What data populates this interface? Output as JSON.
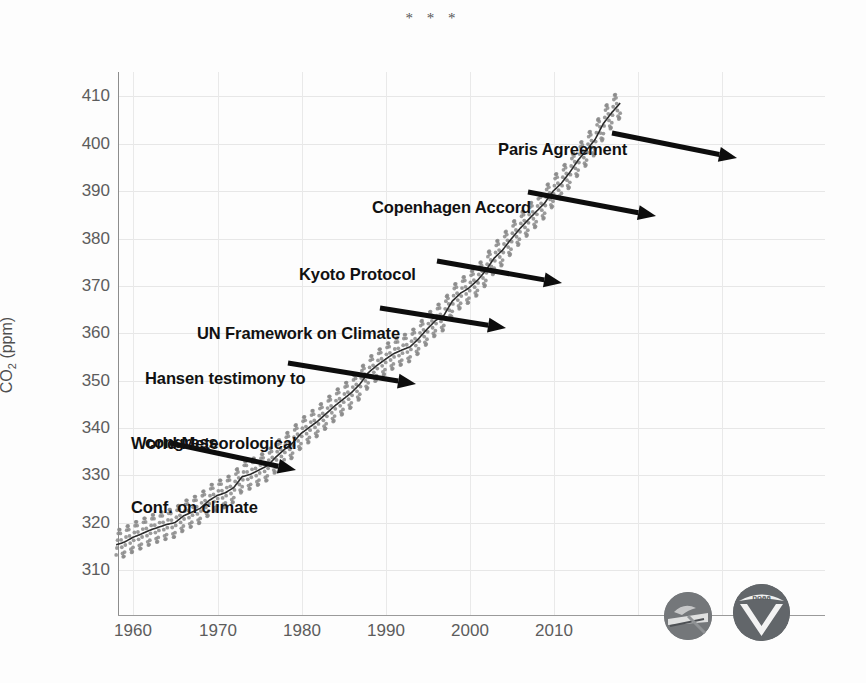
{
  "document": {
    "separator": "* * *"
  },
  "chart_data": {
    "type": "line",
    "title": "",
    "subtitle": "",
    "xlabel": "",
    "ylabel": "CO2 (ppm)",
    "ylabel_parts": {
      "prefix": "CO",
      "sub": "2",
      "suffix": " (ppm)"
    },
    "xlim": [
      1958,
      2018
    ],
    "ylim": [
      305,
      414
    ],
    "grid": true,
    "legend": null,
    "y_ticks": [
      410,
      400,
      390,
      380,
      370,
      360,
      350,
      340,
      330,
      320,
      310
    ],
    "x_ticks": [
      1960,
      1970,
      1980,
      1990,
      2000,
      2010
    ],
    "series": [
      {
        "name": "Monthly mean CO2 (seasonal cycle)",
        "style": "gray-dots",
        "color": "#8a8a8a",
        "note": "monthly values oscillate about the trend by roughly +/-3 ppm"
      },
      {
        "name": "Seasonally corrected trend",
        "style": "dark-line",
        "color": "#2a2a2a"
      }
    ],
    "x": [
      1958,
      1959,
      1960,
      1961,
      1962,
      1963,
      1964,
      1965,
      1966,
      1967,
      1968,
      1969,
      1970,
      1971,
      1972,
      1973,
      1974,
      1975,
      1976,
      1977,
      1978,
      1979,
      1980,
      1981,
      1982,
      1983,
      1984,
      1985,
      1986,
      1987,
      1988,
      1989,
      1990,
      1991,
      1992,
      1993,
      1994,
      1995,
      1996,
      1997,
      1998,
      1999,
      2000,
      2001,
      2002,
      2003,
      2004,
      2005,
      2006,
      2007,
      2008,
      2009,
      2010,
      2011,
      2012,
      2013,
      2014,
      2015,
      2016,
      2017,
      2018
    ],
    "trend_values": [
      315.3,
      315.9,
      316.9,
      317.6,
      318.4,
      319.0,
      319.6,
      320.0,
      321.4,
      322.2,
      323.0,
      324.6,
      325.7,
      326.3,
      327.4,
      329.7,
      330.2,
      331.1,
      332.0,
      333.8,
      335.4,
      336.8,
      338.8,
      340.1,
      341.4,
      343.0,
      344.6,
      346.0,
      347.4,
      349.2,
      351.6,
      353.1,
      354.4,
      355.6,
      356.4,
      357.1,
      358.8,
      360.8,
      362.6,
      363.7,
      366.7,
      368.4,
      369.5,
      371.1,
      373.2,
      375.8,
      377.5,
      379.8,
      381.9,
      383.8,
      385.6,
      387.4,
      389.9,
      391.6,
      393.9,
      396.5,
      398.6,
      400.8,
      404.2,
      406.5,
      408.5
    ],
    "seasonal_amplitude": 3.1,
    "annotations": [
      {
        "id": "world-meteorological-conf",
        "label": "World Meteorological\nConf. on climate",
        "label_lines": [
          "World Meteorological",
          "Conf. on climate"
        ],
        "arrow_from": [
          170,
          443
        ],
        "arrow_to": [
          296,
          470
        ]
      },
      {
        "id": "hansen-testimony",
        "label": "Hansen testimony to\ncongress",
        "label_lines": [
          "Hansen testimony to",
          "congress"
        ],
        "arrow_from": [
          288,
          363
        ],
        "arrow_to": [
          416,
          384
        ]
      },
      {
        "id": "un-framework",
        "label": "UN Framework on Climate",
        "label_lines": [
          "UN Framework on Climate"
        ],
        "arrow_from": [
          380,
          308
        ],
        "arrow_to": [
          506,
          328
        ]
      },
      {
        "id": "kyoto-protocol",
        "label": "Kyoto Protocol",
        "label_lines": [
          "Kyoto Protocol"
        ],
        "arrow_from": [
          437,
          261
        ],
        "arrow_to": [
          562,
          283
        ]
      },
      {
        "id": "copenhagen-accord",
        "label": "Copenhagen Accord",
        "label_lines": [
          "Copenhagen Accord"
        ],
        "arrow_from": [
          528,
          192
        ],
        "arrow_to": [
          656,
          216
        ]
      },
      {
        "id": "paris-agreement",
        "label": "Paris Agreement",
        "label_lines": [
          "Paris Agreement"
        ],
        "arrow_from": [
          612,
          133
        ],
        "arrow_to": [
          737,
          158
        ]
      }
    ],
    "logos": [
      {
        "id": "scripps",
        "name": "scripps-institution-logo",
        "text": ""
      },
      {
        "id": "noaa",
        "name": "noaa-logo",
        "text": "noaa"
      }
    ]
  },
  "annotation_text": {
    "world_meteorological_line1": "World Meteorological",
    "world_meteorological_line2": "Conf. on climate",
    "hansen_line1": "Hansen testimony to",
    "hansen_line2": "congress",
    "un_framework": "UN Framework on Climate",
    "kyoto": "Kyoto Protocol",
    "copenhagen": "Copenhagen Accord",
    "paris": "Paris Agreement"
  },
  "axis_text": {
    "y_410": "410",
    "y_400": "400",
    "y_390": "390",
    "y_380": "380",
    "y_370": "370",
    "y_360": "360",
    "y_350": "350",
    "y_340": "340",
    "y_330": "330",
    "y_320": "320",
    "y_310": "310",
    "x_1960": "1960",
    "x_1970": "1970",
    "x_1980": "1980",
    "x_1990": "1990",
    "x_2000": "2000",
    "x_2010": "2010",
    "ylabel_prefix": "CO",
    "ylabel_sub": "2",
    "ylabel_suffix": " (ppm)"
  },
  "logo_text": {
    "noaa": "noaa"
  },
  "colors": {
    "background": "#fdfdfd",
    "gridline": "#e7e7e7",
    "axis": "#8d8d8d",
    "tick_label": "#5c5c5c",
    "annotation": "#111111",
    "dots": "#8a8a8a",
    "trend": "#2a2a2a",
    "logo_gray": "#6f7275"
  }
}
